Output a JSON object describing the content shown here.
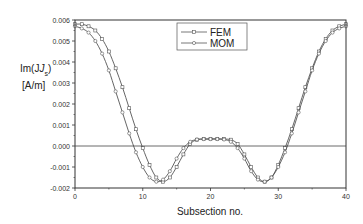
{
  "chart_data": {
    "type": "line",
    "title": "",
    "xlabel": "Subsection no.",
    "ylabel_line1": "Im(J",
    "ylabel_sub": "s",
    "ylabel_line1_end": ")",
    "ylabel_line2": "[A/m]",
    "xlim": [
      0,
      40
    ],
    "ylim": [
      -0.002,
      0.006
    ],
    "xticks": [
      "0",
      "10",
      "20",
      "30",
      "40"
    ],
    "yticks": [
      "0.006",
      "0.005",
      "0.004",
      "0.003",
      "0.002",
      "0.001",
      "0.000",
      "-0.001",
      "-0.002"
    ],
    "grid": false,
    "zero_line": true,
    "legend_position": "upper center",
    "legend": [
      "FEM",
      "MOM"
    ],
    "x": [
      0,
      1,
      2,
      3,
      4,
      5,
      6,
      7,
      8,
      9,
      10,
      11,
      12,
      13,
      14,
      15,
      16,
      17,
      18,
      19,
      20,
      21,
      22,
      23,
      24,
      25,
      26,
      27,
      28,
      29,
      30,
      31,
      32,
      33,
      34,
      35,
      36,
      37,
      38,
      39,
      40
    ],
    "series": [
      {
        "name": "FEM",
        "values": [
          0.0058,
          0.0058,
          0.0057,
          0.0055,
          0.0051,
          0.0045,
          0.0037,
          0.0028,
          0.0018,
          0.0008,
          -0.0001,
          -0.0009,
          -0.0015,
          -0.0017,
          -0.0015,
          -0.001,
          -0.0004,
          0.0001,
          0.0003,
          0.00033,
          0.00034,
          0.00034,
          0.00033,
          0.0003,
          0.0001,
          -0.0004,
          -0.001,
          -0.0015,
          -0.0017,
          -0.0015,
          -0.0009,
          -0.0001,
          0.0008,
          0.0018,
          0.0028,
          0.0037,
          0.0045,
          0.0051,
          0.0055,
          0.0057,
          0.0058
        ]
      },
      {
        "name": "MOM",
        "values": [
          0.0057,
          0.0056,
          0.0054,
          0.005,
          0.0044,
          0.0036,
          0.0026,
          0.0016,
          0.0006,
          -0.0003,
          -0.001,
          -0.0015,
          -0.0017,
          -0.0016,
          -0.0012,
          -0.0006,
          -0.0001,
          0.0002,
          0.00031,
          0.00033,
          0.00033,
          0.00033,
          0.00031,
          0.0002,
          -0.0001,
          -0.0006,
          -0.0012,
          -0.0016,
          -0.0017,
          -0.0015,
          -0.001,
          -0.0003,
          0.0006,
          0.0016,
          0.0026,
          0.0036,
          0.0044,
          0.005,
          0.0054,
          0.0056,
          0.0057
        ]
      }
    ]
  },
  "colors": {
    "line": "#555555",
    "axis": "#333333",
    "background": "#ffffff"
  }
}
